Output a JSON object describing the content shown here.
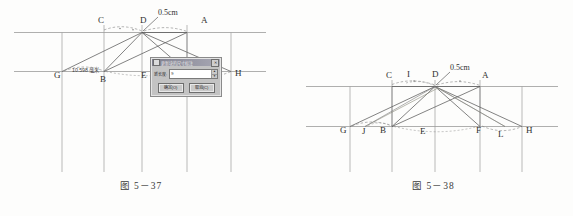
{
  "page": {
    "background_color": "#fdfdfc",
    "ink_color": "#4a4a4a"
  },
  "figures": [
    {
      "id": "fig-5-37",
      "caption": "图 5－37",
      "dimension_note": "10.598 毫米",
      "callout": "0.5cm",
      "top_labels": [
        "C",
        "D",
        "A"
      ],
      "bottom_labels": [
        "G",
        "B",
        "E",
        "H"
      ],
      "labels": {
        "C": "C",
        "D": "D",
        "A": "A",
        "G": "G",
        "B": "B",
        "E": "E",
        "H": "H"
      }
    },
    {
      "id": "fig-5-38",
      "caption": "图 5－38",
      "callout": "0.5cm",
      "top_labels": [
        "C",
        "I",
        "D",
        "A"
      ],
      "bottom_labels": [
        "G",
        "J",
        "B",
        "E",
        "F",
        "L",
        "H"
      ],
      "labels": {
        "C": "C",
        "I": "I",
        "D": "D",
        "A": "A",
        "G": "G",
        "J": "J",
        "B": "B",
        "E": "E",
        "F": "F",
        "L": "L",
        "H": "H"
      }
    }
  ],
  "dialog": {
    "title": "更新块的尺寸标注",
    "system_icon": "window-icon",
    "close_label": "✕",
    "field_label": "新长度:",
    "field_value": "9",
    "spinner_up": "▲",
    "spinner_down": "▼",
    "buttons": [
      {
        "name": "ok",
        "label": "确定(O)"
      },
      {
        "name": "cancel",
        "label": "取消(C)"
      }
    ]
  }
}
